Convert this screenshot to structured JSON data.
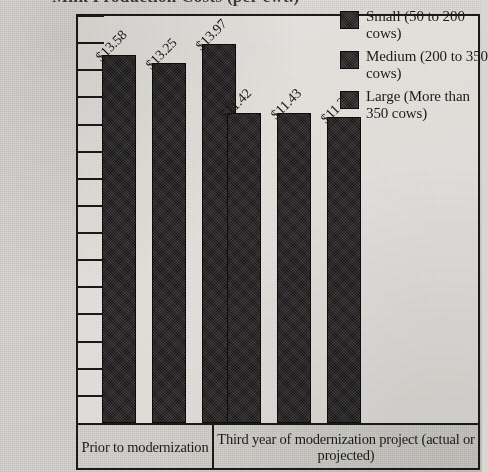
{
  "chart_data": {
    "type": "bar",
    "title": "Milk Production Costs (per cwt.)",
    "title_clipped": true,
    "xlabel": "",
    "ylabel": "",
    "categories": [
      "Prior to modernization",
      "Third year of modernization project (actual or projected)"
    ],
    "series": [
      {
        "name": "Small (50 to 200 cows)",
        "values": [
          13.58,
          11.42
        ],
        "labels": [
          "$13.58",
          "$11.42"
        ]
      },
      {
        "name": "Medium (200 to 350 cows)",
        "values": [
          13.25,
          11.43
        ],
        "labels": [
          "$13.25",
          "$11.43"
        ]
      },
      {
        "name": "Large (More than 350 cows)",
        "values": [
          13.97,
          11.27
        ],
        "labels": [
          "$13.97",
          "$11.27"
        ]
      }
    ],
    "ylim": [
      0,
      15
    ],
    "ytick_step": 1,
    "ytick_labels": [
      "$15.00",
      "$14.00",
      "$13.00",
      "$12.00",
      "$11.00",
      "$10.00",
      "$9.00",
      "$8.00",
      "$7.00",
      "$6.00",
      "$5.00",
      "$4.00",
      "$3.00",
      "$2.00",
      "$1.00",
      "$0.00"
    ],
    "grid": false,
    "legend_position": "top-right",
    "bar_color": "#1a1818",
    "axis_color": "#1c1a18",
    "data_label_rotation": -45
  },
  "legend": {
    "items": [
      {
        "label": "Small (50 to 200 cows)"
      },
      {
        "label": "Medium (200 to 350 cows)"
      },
      {
        "label": "Large (More than 350 cows)"
      }
    ]
  },
  "axis": {
    "categories": [
      "Prior to modernization",
      "Third year of modernization project (actual or projected)"
    ]
  }
}
